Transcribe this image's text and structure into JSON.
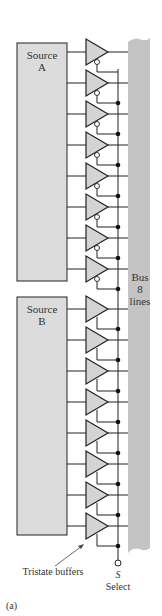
{
  "figure": {
    "label": "(a)",
    "colors": {
      "box_fill": "#dcdcdc",
      "bus_fill": "#c4c4c4",
      "buffer_fill": "#d4d4d4",
      "stroke": "#222222",
      "text": "#333333"
    }
  },
  "source_a": {
    "line1": "Source",
    "line2": "A"
  },
  "source_b": {
    "line1": "Source",
    "line2": "B"
  },
  "bus": {
    "line1": "Bus",
    "line2": "8",
    "line3": "lines"
  },
  "select": {
    "symbol": "S",
    "label": "Select"
  },
  "annotation": {
    "tristate": "Tristate buffers"
  },
  "buffers": {
    "source_a_count": 8,
    "source_b_count": 8,
    "source_a_enable": "active-low (inverting bubble)",
    "source_b_enable": "active-high"
  }
}
